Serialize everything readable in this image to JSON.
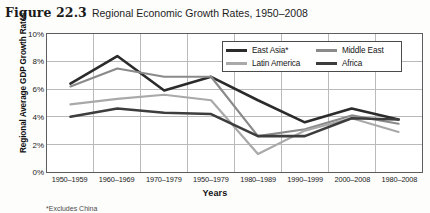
{
  "figure": {
    "label": "Figure 22.3",
    "title": "Regional Economic Growth Rates, 1950–2008",
    "footnote": "*Excludes China"
  },
  "colors": {
    "east_asia": "#2b2b2b",
    "middle_east": "#8a8a8a",
    "latin_america": "#a9a9a9",
    "africa": "#3d3d3d",
    "axis": "#5c5c5c",
    "grid": "#b9b9b9",
    "text": "#1a1a1a",
    "plot_background": "#ffffff",
    "page_background": "#fdfdfc"
  },
  "legend": {
    "position": "inside-top-right",
    "entries": [
      {
        "label": "East Asia*",
        "color": "#2b2b2b",
        "row": 0,
        "col": 0
      },
      {
        "label": "Middle East",
        "color": "#8a8a8a",
        "row": 0,
        "col": 1
      },
      {
        "label": "Latin America",
        "color": "#a9a9a9",
        "row": 1,
        "col": 0
      },
      {
        "label": "Africa",
        "color": "#3d3d3d",
        "row": 1,
        "col": 1
      }
    ]
  },
  "chart_data": {
    "type": "line",
    "title": "Regional Economic Growth Rates, 1950–2008",
    "xlabel": "Years",
    "ylabel": "Regional Average GDP Growth Rates",
    "grid": true,
    "ylim": [
      0,
      10
    ],
    "ytick_values": [
      0,
      2,
      4,
      6,
      8,
      10
    ],
    "ytick_labels": [
      "0%",
      "2%",
      "4%",
      "6%",
      "8%",
      "10%"
    ],
    "categories": [
      "1950–1959",
      "1960–1969",
      "1970–1979",
      "1950–1979",
      "1980–1989",
      "1990–1999",
      "2000–2008",
      "1980–2008"
    ],
    "series": [
      {
        "name": "East Asia*",
        "color": "#2b2b2b",
        "values": [
          6.4,
          8.4,
          5.9,
          6.9,
          5.2,
          3.6,
          4.6,
          3.8
        ]
      },
      {
        "name": "Middle East",
        "color": "#8a8a8a",
        "values": [
          6.2,
          7.5,
          6.9,
          6.9,
          2.6,
          3.1,
          4.1,
          3.5
        ]
      },
      {
        "name": "Latin America",
        "color": "#a9a9a9",
        "values": [
          4.9,
          5.3,
          5.6,
          5.2,
          1.3,
          3.0,
          3.9,
          2.9
        ]
      },
      {
        "name": "Africa",
        "color": "#3d3d3d",
        "values": [
          4.0,
          4.6,
          4.3,
          4.2,
          2.6,
          2.6,
          3.9,
          3.8
        ]
      }
    ]
  }
}
